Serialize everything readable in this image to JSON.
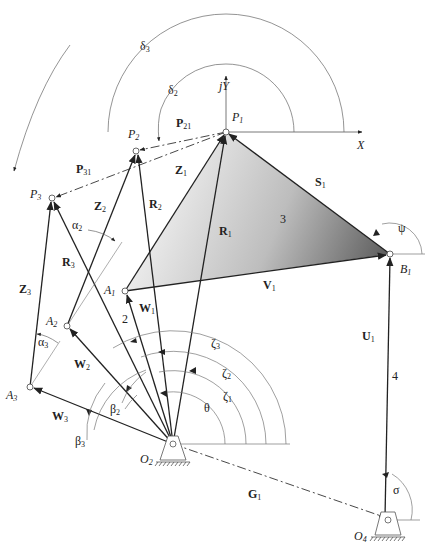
{
  "diagram": {
    "type": "three-position motion generation four-bar linkage",
    "axes": {
      "x_label": "X",
      "y_label": "jY"
    },
    "points": {
      "P1": {
        "label": "P",
        "sub": "1"
      },
      "P2": {
        "label": "P",
        "sub": "2"
      },
      "P3": {
        "label": "P",
        "sub": "3"
      },
      "A1": {
        "label": "A",
        "sub": "1"
      },
      "A2": {
        "label": "A",
        "sub": "2"
      },
      "A3": {
        "label": "A",
        "sub": "3"
      },
      "B1": {
        "label": "B",
        "sub": "1"
      },
      "O2": {
        "label": "O",
        "sub": "2"
      },
      "O4": {
        "label": "O",
        "sub": "4"
      }
    },
    "vectors": {
      "P21": {
        "label": "P",
        "sub": "21"
      },
      "P31": {
        "label": "P",
        "sub": "31"
      },
      "Z1": {
        "label": "Z",
        "sub": "1"
      },
      "Z2": {
        "label": "Z",
        "sub": "2"
      },
      "Z3": {
        "label": "Z",
        "sub": "3"
      },
      "R1": {
        "label": "R",
        "sub": "1"
      },
      "R2": {
        "label": "R",
        "sub": "2"
      },
      "R3": {
        "label": "R",
        "sub": "3"
      },
      "W1": {
        "label": "W",
        "sub": "1"
      },
      "W2": {
        "label": "W",
        "sub": "2"
      },
      "W3": {
        "label": "W",
        "sub": "3"
      },
      "S1": {
        "label": "S",
        "sub": "1"
      },
      "V1": {
        "label": "V",
        "sub": "1"
      },
      "U1": {
        "label": "U",
        "sub": "1"
      },
      "G1": {
        "label": "G",
        "sub": "1"
      }
    },
    "angles": {
      "delta2": {
        "label": "δ",
        "sub": "2"
      },
      "delta3": {
        "label": "δ",
        "sub": "3"
      },
      "alpha2": {
        "label": "α",
        "sub": "2"
      },
      "alpha3": {
        "label": "α",
        "sub": "3"
      },
      "beta2": {
        "label": "β",
        "sub": "2"
      },
      "beta3": {
        "label": "β",
        "sub": "3"
      },
      "zeta1": {
        "label": "ζ",
        "sub": "1"
      },
      "zeta2": {
        "label": "ζ",
        "sub": "2"
      },
      "zeta3": {
        "label": "ζ",
        "sub": "3"
      },
      "theta": {
        "label": "θ"
      },
      "psi": {
        "label": "ψ"
      },
      "sigma": {
        "label": "σ"
      }
    },
    "links": {
      "link2": "2",
      "link3": "3",
      "link4": "4"
    },
    "colors": {
      "line": "#2a2a2a",
      "thin": "#777777",
      "coupler_light": "#f4f4f4",
      "coupler_dark": "#6e6e6e"
    }
  }
}
